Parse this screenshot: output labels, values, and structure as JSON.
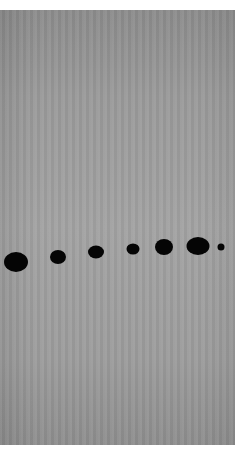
{
  "image": {
    "description": "Gray textured panel with a horizontal row of seven black oval dots of varying sizes",
    "background_color": "#ffffff",
    "panel_color": "#9c9c9c",
    "dot_color": "#050505"
  },
  "dots": [
    {
      "cx": 16,
      "cy": 262,
      "w": 24,
      "h": 20
    },
    {
      "cx": 58,
      "cy": 257,
      "w": 16,
      "h": 14
    },
    {
      "cx": 96,
      "cy": 252,
      "w": 16,
      "h": 13
    },
    {
      "cx": 133,
      "cy": 249,
      "w": 13,
      "h": 11
    },
    {
      "cx": 164,
      "cy": 247,
      "w": 18,
      "h": 16
    },
    {
      "cx": 198,
      "cy": 246,
      "w": 23,
      "h": 18
    },
    {
      "cx": 221,
      "cy": 247,
      "w": 7,
      "h": 7
    }
  ]
}
